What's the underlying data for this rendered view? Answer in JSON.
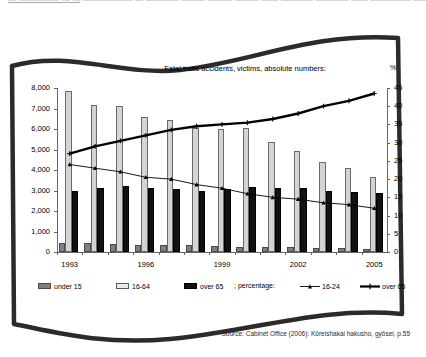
{
  "top_cut_text": "― ―――――   ―   ―  ―――――― ―   ―――― ―――  ――― ――― ―― ―――― ―――― ―― ――――― ――  ―  y",
  "chart_title": "Fatal trafic accidents, victims, absolute numbers:",
  "percent_axis_label": "%",
  "source": "Source: Cabinet Office (2006): Kōreishakai hakusho, gyōsei, p.55",
  "legend": {
    "bar_items": [
      {
        "label": "under 15",
        "key": "u15",
        "color": "#7f7f7f"
      },
      {
        "label": "16-64",
        "key": "b1664",
        "color": "#ebebeb"
      },
      {
        "label": "over 65",
        "key": "o65",
        "color": "#111111"
      }
    ],
    "percentage_label": "; percentage:",
    "line_items": [
      {
        "label": "16-24",
        "key": "p1624",
        "color": "#000000"
      },
      {
        "label": "over 65",
        "key": "po65",
        "color": "#000000"
      }
    ]
  },
  "chart_data": {
    "type": "bar",
    "title": "Fatal trafic accidents, victims, absolute numbers:",
    "xlabel": "",
    "ylabel": "",
    "y2label": "%",
    "ylim": [
      0,
      8000
    ],
    "y2lim": [
      0,
      45
    ],
    "yticks": [
      "0",
      "1,000",
      "2,000",
      "3,000",
      "4,000",
      "5,000",
      "6,000",
      "7,000",
      "8,000"
    ],
    "ytick_values": [
      0,
      1000,
      2000,
      3000,
      4000,
      5000,
      6000,
      7000,
      8000
    ],
    "y2ticks": [
      "0",
      "5",
      "10",
      "15",
      "20",
      "25",
      "30",
      "35",
      "40",
      "45"
    ],
    "y2tick_values": [
      0,
      5,
      10,
      15,
      20,
      25,
      30,
      35,
      40,
      45
    ],
    "grid": false,
    "legend_position": "bottom",
    "categories": [
      1993,
      1994,
      1995,
      1996,
      1997,
      1998,
      1999,
      2000,
      2001,
      2002,
      2003,
      2004,
      2005
    ],
    "xtick_labels": [
      "1993",
      "",
      "",
      "1996",
      "",
      "",
      "1999",
      "",
      "",
      "2002",
      "",
      "",
      "2005"
    ],
    "series": [
      {
        "name": "under 15",
        "axis": "left",
        "type": "bar",
        "values": [
          450,
          430,
          400,
          330,
          350,
          330,
          300,
          250,
          240,
          230,
          200,
          180,
          150
        ]
      },
      {
        "name": "16-64",
        "axis": "left",
        "type": "bar",
        "values": [
          7850,
          7150,
          7100,
          6600,
          6450,
          6050,
          6000,
          6050,
          5350,
          4950,
          4400,
          4100,
          3650
        ]
      },
      {
        "name": "over 65",
        "axis": "left",
        "type": "bar",
        "values": [
          3000,
          3100,
          3200,
          3100,
          3050,
          3000,
          3050,
          3150,
          3100,
          3100,
          3000,
          2950,
          2900
        ]
      },
      {
        "name": "over 65",
        "axis": "right",
        "type": "line",
        "style": "thick",
        "values": [
          27.0,
          29.0,
          30.5,
          32.0,
          33.5,
          34.5,
          35.0,
          35.5,
          36.5,
          38.0,
          40.0,
          41.5,
          43.5
        ]
      },
      {
        "name": "16-24",
        "axis": "right",
        "type": "line",
        "style": "thin",
        "values": [
          24.0,
          23.0,
          22.0,
          20.5,
          20.0,
          18.5,
          17.5,
          16.0,
          15.0,
          14.5,
          13.5,
          13.0,
          12.0
        ]
      }
    ]
  }
}
